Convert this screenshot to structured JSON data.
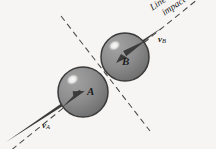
{
  "figure": {
    "background_color": "#f6f5f3",
    "width": 216,
    "height": 149
  },
  "annotations": {
    "line_of_impact_line1": "Line of",
    "line_of_impact_line2": "impact",
    "ball_a_label": "A",
    "ball_b_label": "B",
    "velocity_a_symbol": "v",
    "velocity_a_subscript": "A",
    "velocity_b_symbol": "v",
    "velocity_b_subscript": "B"
  },
  "geometry": {
    "ball_a": {
      "cx": 83,
      "cy": 92,
      "r": 25
    },
    "ball_b": {
      "cx": 125,
      "cy": 57,
      "r": 24
    },
    "contact_point": {
      "x": 104.5,
      "y": 75
    },
    "line_of_impact_angle_deg": -39,
    "plane_of_contact_angle_deg": 51
  },
  "colors": {
    "sphere_fill": "#8d8d8d",
    "sphere_fill_dark": "#6f6f6f",
    "sphere_outline": "#3a3a3a",
    "highlight": "#f2f2f0",
    "arrow": "#3b3b3b",
    "dashed_line": "#4a4a4a",
    "text": "#1c1c1c"
  }
}
